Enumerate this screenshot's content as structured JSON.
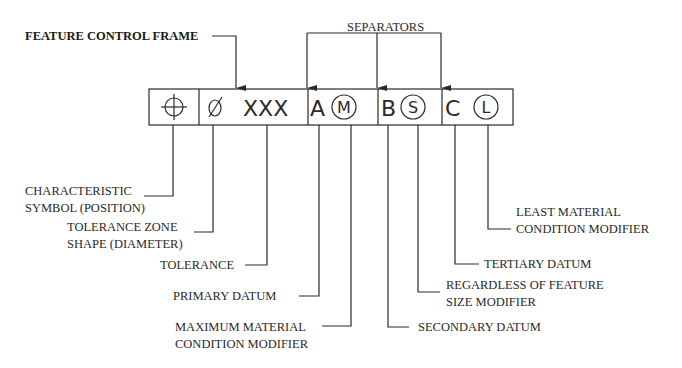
{
  "title_label": "FEATURE CONTROL FRAME",
  "separators_label": "SEPARATORS",
  "frame": {
    "symbol": "position-symbol",
    "diameter": "∅",
    "tolerance": "XXX",
    "primary_datum": "A",
    "primary_modifier": "M",
    "secondary_datum": "B",
    "secondary_modifier": "S",
    "tertiary_datum": "C",
    "tertiary_modifier": "L"
  },
  "callouts": {
    "characteristic": [
      "CHARACTERISTIC",
      "SYMBOL (POSITION)"
    ],
    "zone_shape": [
      "TOLERANCE ZONE",
      "SHAPE (DIAMETER)"
    ],
    "tolerance": [
      "TOLERANCE"
    ],
    "primary_datum": [
      "PRIMARY DATUM"
    ],
    "mmc_modifier": [
      "MAXIMUM MATERIAL",
      "CONDITION MODIFIER"
    ],
    "secondary_datum": [
      "SECONDARY DATUM"
    ],
    "rfs_modifier": [
      "REGARDLESS OF FEATURE",
      "SIZE MODIFIER"
    ],
    "tertiary_datum": [
      "TERTIARY DATUM"
    ],
    "lmc_modifier": [
      "LEAST MATERIAL",
      "CONDITION MODIFIER"
    ]
  },
  "colors": {
    "ink": "#2a2a2a",
    "background": "#ffffff"
  }
}
